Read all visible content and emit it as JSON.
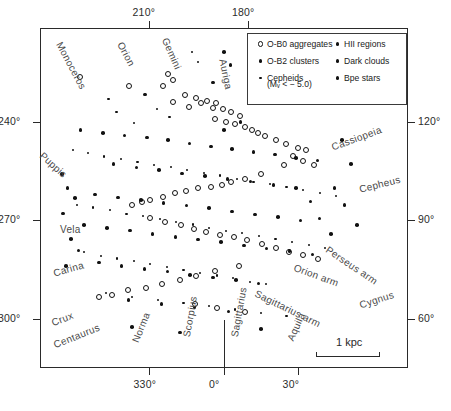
{
  "figure": {
    "scale_bar_label": "1 kpc"
  },
  "axes": {
    "top_ticks": [
      {
        "label": "210°",
        "x": 0.295
      },
      {
        "label": "180°",
        "x": 0.565
      }
    ],
    "left_ticks": [
      {
        "label": "240°",
        "y": 0.275
      },
      {
        "label": "270°",
        "y": 0.565
      },
      {
        "label": "300°",
        "y": 0.855
      }
    ],
    "right_ticks": [
      {
        "label": "120°",
        "y": 0.275
      },
      {
        "label": "90°",
        "y": 0.565
      },
      {
        "label": "60°",
        "y": 0.855
      }
    ],
    "bottom_ticks": [
      {
        "label": "330°",
        "x": 0.295
      },
      {
        "label": "0°",
        "x": 0.5
      },
      {
        "label": "30°",
        "x": 0.7
      }
    ]
  },
  "legend": {
    "left_column": [
      {
        "label": "O-B0 aggregates",
        "marker": "open-circle-marker"
      },
      {
        "label": "O-B2 clusters",
        "marker": "medium-dot-marker"
      },
      {
        "label": "Cepheids",
        "marker": "small-dot-marker",
        "sub": "(Mᵥ <  − 5.0)"
      }
    ],
    "right_column": [
      {
        "label": "HII regions",
        "marker": "medium-dot-marker"
      },
      {
        "label": "Dark clouds",
        "marker": "medium-dot-marker"
      },
      {
        "label": "Bpe stars",
        "marker": "medium-dot-marker"
      }
    ]
  },
  "constellation_labels": [
    {
      "name": "Monoceros",
      "x": 64,
      "y": 40,
      "rot": 62
    },
    {
      "name": "Orion",
      "x": 125,
      "y": 40,
      "rot": 62
    },
    {
      "name": "Gemini",
      "x": 170,
      "y": 36,
      "rot": 66
    },
    {
      "name": "Auriga",
      "x": 228,
      "y": 58,
      "rot": 78
    },
    {
      "name": "Puppis",
      "x": 45,
      "y": 150,
      "rot": 42
    },
    {
      "name": "Vela",
      "x": 60,
      "y": 224,
      "rot": 0
    },
    {
      "name": "Carina",
      "x": 52,
      "y": 268,
      "rot": -16
    },
    {
      "name": "Crux",
      "x": 50,
      "y": 318,
      "rot": -22
    },
    {
      "name": "Centaurus",
      "x": 52,
      "y": 340,
      "rot": -22
    },
    {
      "name": "Norma",
      "x": 130,
      "y": 340,
      "rot": -68
    },
    {
      "name": "Scorpius",
      "x": 181,
      "y": 336,
      "rot": -80
    },
    {
      "name": "Sagittarius",
      "x": 229,
      "y": 336,
      "rot": -80
    },
    {
      "name": "Aquila",
      "x": 285,
      "y": 338,
      "rot": -66
    },
    {
      "name": "Cassiopeia",
      "x": 330,
      "y": 142,
      "rot": -20
    },
    {
      "name": "Cepheus",
      "x": 358,
      "y": 184,
      "rot": -14
    },
    {
      "name": "Cygnus",
      "x": 358,
      "y": 300,
      "rot": -18
    }
  ],
  "arm_labels": [
    {
      "name": "Perseus arm",
      "x": 330,
      "y": 244,
      "rot": 34
    },
    {
      "name": "Orion arm",
      "x": 296,
      "y": 262,
      "rot": 20
    },
    {
      "name": "Sagittarius arm",
      "x": 258,
      "y": 288,
      "rot": 26
    }
  ],
  "chart_data": {
    "type": "scatter",
    "xlabel": "Galactic longitude",
    "ylabel": "Galactic longitude",
    "xlim": [
      0,
      1
    ],
    "ylim": [
      0,
      1
    ],
    "grid": false,
    "legend_position": "top-right-inset",
    "axis_units": "degrees of galactic longitude",
    "scale_bar_kpc": 1,
    "series": [
      {
        "name": "O-B0 aggregates",
        "marker": "open-circle",
        "points": [
          [
            0.347,
            0.134
          ],
          [
            0.362,
            0.154
          ],
          [
            0.335,
            0.172
          ],
          [
            0.47,
            0.236
          ],
          [
            0.241,
            0.172
          ],
          [
            0.11,
            0.145
          ],
          [
            0.393,
            0.196
          ],
          [
            0.424,
            0.205
          ],
          [
            0.362,
            0.219
          ],
          [
            0.404,
            0.232
          ],
          [
            0.437,
            0.222
          ],
          [
            0.455,
            0.214
          ],
          [
            0.478,
            0.222
          ],
          [
            0.498,
            0.238
          ],
          [
            0.52,
            0.248
          ],
          [
            0.543,
            0.258
          ],
          [
            0.476,
            0.268
          ],
          [
            0.506,
            0.276
          ],
          [
            0.53,
            0.282
          ],
          [
            0.556,
            0.292
          ],
          [
            0.575,
            0.3
          ],
          [
            0.592,
            0.31
          ],
          [
            0.612,
            0.318
          ],
          [
            0.64,
            0.33
          ],
          [
            0.668,
            0.342
          ],
          [
            0.7,
            0.352
          ],
          [
            0.722,
            0.36
          ],
          [
            0.688,
            0.376
          ],
          [
            0.716,
            0.392
          ],
          [
            0.745,
            0.404
          ],
          [
            0.662,
            0.404
          ],
          [
            0.6,
            0.43
          ],
          [
            0.556,
            0.444
          ],
          [
            0.52,
            0.452
          ],
          [
            0.494,
            0.462
          ],
          [
            0.464,
            0.468
          ],
          [
            0.43,
            0.472
          ],
          [
            0.398,
            0.48
          ],
          [
            0.368,
            0.486
          ],
          [
            0.335,
            0.496
          ],
          [
            0.3,
            0.506
          ],
          [
            0.276,
            0.512
          ],
          [
            0.25,
            0.522
          ],
          [
            0.3,
            0.56
          ],
          [
            0.34,
            0.572
          ],
          [
            0.382,
            0.58
          ],
          [
            0.418,
            0.59
          ],
          [
            0.452,
            0.6
          ],
          [
            0.49,
            0.61
          ],
          [
            0.528,
            0.616
          ],
          [
            0.562,
            0.624
          ],
          [
            0.604,
            0.636
          ],
          [
            0.64,
            0.648
          ],
          [
            0.676,
            0.658
          ],
          [
            0.716,
            0.668
          ],
          [
            0.756,
            0.68
          ],
          [
            0.54,
            0.7
          ],
          [
            0.476,
            0.716
          ],
          [
            0.424,
            0.728
          ],
          [
            0.38,
            0.742
          ],
          [
            0.332,
            0.752
          ],
          [
            0.288,
            0.764
          ],
          [
            0.24,
            0.772
          ],
          [
            0.196,
            0.784
          ],
          [
            0.16,
            0.792
          ],
          [
            0.42,
            0.812
          ],
          [
            0.48,
            0.824
          ],
          [
            0.556,
            0.836
          ]
        ]
      },
      {
        "name": "O-B2 clusters",
        "marker": "medium-dot",
        "points": [
          [
            0.285,
            0.196
          ],
          [
            0.545,
            0.276
          ],
          [
            0.11,
            0.3
          ],
          [
            0.172,
            0.308
          ],
          [
            0.23,
            0.316
          ],
          [
            0.29,
            0.322
          ],
          [
            0.348,
            0.33
          ],
          [
            0.406,
            0.34
          ],
          [
            0.464,
            0.348
          ],
          [
            0.522,
            0.356
          ],
          [
            0.58,
            0.364
          ],
          [
            0.638,
            0.372
          ],
          [
            0.696,
            0.382
          ],
          [
            0.754,
            0.39
          ],
          [
            0.2,
            0.4
          ],
          [
            0.262,
            0.41
          ],
          [
            0.324,
            0.418
          ],
          [
            0.386,
            0.428
          ],
          [
            0.448,
            0.436
          ],
          [
            0.51,
            0.444
          ],
          [
            0.572,
            0.452
          ],
          [
            0.634,
            0.462
          ],
          [
            0.696,
            0.47
          ],
          [
            0.15,
            0.49
          ],
          [
            0.212,
            0.498
          ],
          [
            0.274,
            0.506
          ],
          [
            0.336,
            0.514
          ],
          [
            0.398,
            0.522
          ],
          [
            0.46,
            0.53
          ],
          [
            0.522,
            0.54
          ],
          [
            0.584,
            0.548
          ],
          [
            0.646,
            0.556
          ],
          [
            0.708,
            0.566
          ],
          [
            0.12,
            0.58
          ],
          [
            0.182,
            0.588
          ],
          [
            0.244,
            0.596
          ],
          [
            0.306,
            0.606
          ],
          [
            0.368,
            0.614
          ],
          [
            0.43,
            0.622
          ],
          [
            0.492,
            0.63
          ],
          [
            0.554,
            0.64
          ],
          [
            0.616,
            0.648
          ],
          [
            0.678,
            0.656
          ],
          [
            0.74,
            0.666
          ],
          [
            0.16,
            0.69
          ],
          [
            0.222,
            0.7
          ],
          [
            0.284,
            0.708
          ],
          [
            0.346,
            0.716
          ],
          [
            0.408,
            0.726
          ],
          [
            0.47,
            0.734
          ],
          [
            0.532,
            0.742
          ],
          [
            0.594,
            0.752
          ],
          [
            0.24,
            0.8
          ],
          [
            0.33,
            0.812
          ],
          [
            0.42,
            0.822
          ],
          [
            0.512,
            0.834
          ]
        ]
      },
      {
        "name": "Cepheids",
        "marker": "small-dot",
        "points": [
          [
            0.412,
            0.07
          ],
          [
            0.43,
            0.1
          ],
          [
            0.186,
            0.21
          ],
          [
            0.208,
            0.248
          ],
          [
            0.255,
            0.28
          ],
          [
            0.318,
            0.238
          ],
          [
            0.352,
            0.262
          ],
          [
            0.09,
            0.36
          ],
          [
            0.13,
            0.368
          ],
          [
            0.175,
            0.378
          ],
          [
            0.22,
            0.386
          ],
          [
            0.265,
            0.394
          ],
          [
            0.31,
            0.402
          ],
          [
            0.355,
            0.41
          ],
          [
            0.4,
            0.418
          ],
          [
            0.445,
            0.426
          ],
          [
            0.49,
            0.434
          ],
          [
            0.535,
            0.444
          ],
          [
            0.58,
            0.452
          ],
          [
            0.625,
            0.46
          ],
          [
            0.67,
            0.468
          ],
          [
            0.715,
            0.476
          ],
          [
            0.76,
            0.486
          ],
          [
            0.805,
            0.494
          ],
          [
            0.1,
            0.52
          ],
          [
            0.145,
            0.528
          ],
          [
            0.19,
            0.536
          ],
          [
            0.235,
            0.546
          ],
          [
            0.28,
            0.554
          ],
          [
            0.325,
            0.562
          ],
          [
            0.37,
            0.57
          ],
          [
            0.415,
            0.578
          ],
          [
            0.46,
            0.588
          ],
          [
            0.505,
            0.596
          ],
          [
            0.55,
            0.604
          ],
          [
            0.595,
            0.612
          ],
          [
            0.64,
            0.62
          ],
          [
            0.685,
            0.63
          ],
          [
            0.73,
            0.638
          ],
          [
            0.775,
            0.646
          ],
          [
            0.12,
            0.66
          ],
          [
            0.165,
            0.67
          ],
          [
            0.21,
            0.678
          ],
          [
            0.255,
            0.686
          ],
          [
            0.3,
            0.694
          ],
          [
            0.345,
            0.704
          ],
          [
            0.39,
            0.712
          ],
          [
            0.435,
            0.72
          ],
          [
            0.48,
            0.728
          ],
          [
            0.525,
            0.736
          ],
          [
            0.57,
            0.746
          ],
          [
            0.615,
            0.754
          ],
          [
            0.18,
            0.78
          ],
          [
            0.25,
            0.79
          ],
          [
            0.32,
            0.8
          ],
          [
            0.39,
            0.81
          ],
          [
            0.46,
            0.818
          ],
          [
            0.53,
            0.828
          ],
          [
            0.6,
            0.838
          ],
          [
            0.67,
            0.848
          ]
        ]
      },
      {
        "name": "HII regions",
        "marker": "medium-dot",
        "points": [
          [
            0.82,
            0.33
          ],
          [
            0.845,
            0.4
          ],
          [
            0.8,
            0.47
          ],
          [
            0.828,
            0.52
          ],
          [
            0.862,
            0.58
          ],
          [
            0.79,
            0.606
          ],
          [
            0.76,
            0.56
          ],
          [
            0.735,
            0.51
          ]
        ]
      },
      {
        "name": "Dark clouds",
        "marker": "medium-dot",
        "points": [
          [
            0.06,
            0.43
          ],
          [
            0.075,
            0.47
          ],
          [
            0.095,
            0.5
          ],
          [
            0.062,
            0.545
          ],
          [
            0.085,
            0.62
          ],
          [
            0.105,
            0.655
          ],
          [
            0.07,
            0.7
          ]
        ]
      },
      {
        "name": "Bpe stars",
        "marker": "medium-dot",
        "points": [
          [
            0.5,
            0.07
          ],
          [
            0.518,
            0.108
          ],
          [
            0.47,
            0.16
          ],
          [
            0.5,
            0.3
          ],
          [
            0.25,
            0.88
          ],
          [
            0.38,
            0.896
          ],
          [
            0.6,
            0.886
          ]
        ]
      }
    ]
  }
}
